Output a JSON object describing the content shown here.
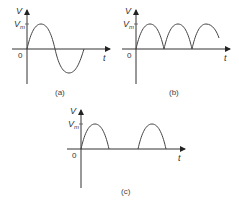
{
  "diagram": {
    "panels": [
      {
        "id": "a",
        "caption": "(a)",
        "y_axis_label": "V",
        "peak_label": "V",
        "peak_subscript": "m",
        "origin_label": "0",
        "x_axis_label": "t",
        "waveform": "sine"
      },
      {
        "id": "b",
        "caption": "(b)",
        "y_axis_label": "V",
        "peak_label": "V",
        "peak_subscript": "m",
        "origin_label": "0",
        "x_axis_label": "t",
        "waveform": "full-wave-rectified"
      },
      {
        "id": "c",
        "caption": "(c)",
        "y_axis_label": "V",
        "peak_label": "V",
        "peak_subscript": "m",
        "origin_label": "0",
        "x_axis_label": "t",
        "waveform": "half-wave-rectified"
      }
    ],
    "colors": {
      "axis": "#333333",
      "curve": "#444444",
      "text": "#333333"
    }
  }
}
